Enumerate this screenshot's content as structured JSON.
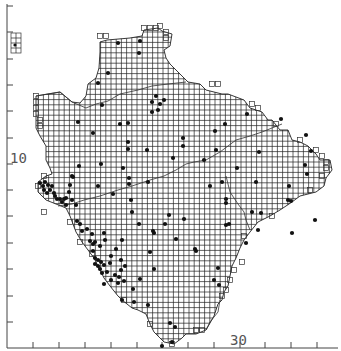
{
  "map": {
    "type": "grid distribution map",
    "axis_labels": {
      "left": "10",
      "bottom": "30"
    },
    "left_axis_ticks_y": [
      6,
      32,
      59,
      85,
      111,
      138,
      164,
      190,
      216,
      243,
      269,
      296,
      322
    ],
    "bottom_axis_ticks_x": [
      33,
      59,
      85,
      111,
      137,
      162,
      188,
      214,
      240,
      265,
      291,
      317
    ],
    "grid_cell_px": 5.2,
    "colors": {
      "line": "#222222",
      "dot": "#111111",
      "label": "#555555",
      "background": "#ffffff"
    },
    "records_count_approx": 150,
    "records": [
      [
        118,
        43
      ],
      [
        140,
        41
      ],
      [
        139,
        53
      ],
      [
        108,
        73
      ],
      [
        98,
        83
      ],
      [
        102,
        105
      ],
      [
        156,
        96
      ],
      [
        160,
        104
      ],
      [
        152,
        102
      ],
      [
        152,
        112
      ],
      [
        164,
        100
      ],
      [
        158,
        110
      ],
      [
        78,
        122
      ],
      [
        120,
        124
      ],
      [
        128,
        123
      ],
      [
        93,
        133
      ],
      [
        128,
        142
      ],
      [
        128,
        149
      ],
      [
        147,
        150
      ],
      [
        123,
        168
      ],
      [
        129,
        178
      ],
      [
        129,
        184
      ],
      [
        113,
        194
      ],
      [
        98,
        186
      ],
      [
        183,
        138
      ],
      [
        183,
        146
      ],
      [
        173,
        158
      ],
      [
        148,
        182
      ],
      [
        215,
        131
      ],
      [
        225,
        124
      ],
      [
        281,
        119
      ],
      [
        247,
        114
      ],
      [
        216,
        150
      ],
      [
        204,
        160
      ],
      [
        237,
        168
      ],
      [
        259,
        152
      ],
      [
        306,
        135
      ],
      [
        311,
        151
      ],
      [
        305,
        165
      ],
      [
        307,
        174
      ],
      [
        289,
        186
      ],
      [
        291,
        201
      ],
      [
        315,
        220
      ],
      [
        292,
        233
      ],
      [
        288,
        200
      ],
      [
        222,
        182
      ],
      [
        226,
        199
      ],
      [
        226,
        203
      ],
      [
        256,
        182
      ],
      [
        210,
        186
      ],
      [
        252,
        212
      ],
      [
        261,
        213
      ],
      [
        258,
        230
      ],
      [
        229,
        224
      ],
      [
        226,
        225
      ],
      [
        246,
        243
      ],
      [
        218,
        268
      ],
      [
        214,
        280
      ],
      [
        219,
        285
      ],
      [
        40,
        183
      ],
      [
        45,
        182
      ],
      [
        43,
        186
      ],
      [
        48,
        185
      ],
      [
        52,
        186
      ],
      [
        50,
        190
      ],
      [
        44,
        190
      ],
      [
        47,
        193
      ],
      [
        54,
        193
      ],
      [
        55,
        196
      ],
      [
        57,
        199
      ],
      [
        60,
        199
      ],
      [
        62,
        202
      ],
      [
        64,
        199
      ],
      [
        66,
        198
      ],
      [
        70,
        185
      ],
      [
        72,
        176
      ],
      [
        69,
        192
      ],
      [
        72,
        200
      ],
      [
        76,
        205
      ],
      [
        66,
        205
      ],
      [
        73,
        177
      ],
      [
        79,
        166
      ],
      [
        101,
        164
      ],
      [
        77,
        221
      ],
      [
        80,
        224
      ],
      [
        82,
        231
      ],
      [
        87,
        229
      ],
      [
        92,
        234
      ],
      [
        90,
        241
      ],
      [
        95,
        242
      ],
      [
        100,
        246
      ],
      [
        105,
        240
      ],
      [
        104,
        233
      ],
      [
        93,
        244
      ],
      [
        93,
        251
      ],
      [
        95,
        258
      ],
      [
        98,
        260
      ],
      [
        95,
        264
      ],
      [
        98,
        266
      ],
      [
        101,
        262
      ],
      [
        100,
        269
      ],
      [
        104,
        265
      ],
      [
        102,
        273
      ],
      [
        107,
        272
      ],
      [
        110,
        263
      ],
      [
        111,
        256
      ],
      [
        116,
        249
      ],
      [
        122,
        240
      ],
      [
        121,
        260
      ],
      [
        115,
        275
      ],
      [
        118,
        283
      ],
      [
        104,
        284
      ],
      [
        119,
        277
      ],
      [
        111,
        280
      ],
      [
        133,
        289
      ],
      [
        140,
        279
      ],
      [
        154,
        269
      ],
      [
        150,
        252
      ],
      [
        153,
        231
      ],
      [
        139,
        224
      ],
      [
        132,
        212
      ],
      [
        131,
        200
      ],
      [
        154,
        233
      ],
      [
        165,
        224
      ],
      [
        184,
        219
      ],
      [
        169,
        215
      ],
      [
        176,
        239
      ],
      [
        195,
        249
      ],
      [
        196,
        251
      ],
      [
        122,
        300
      ],
      [
        134,
        302
      ],
      [
        148,
        305
      ],
      [
        170,
        323
      ],
      [
        175,
        327
      ],
      [
        162,
        346
      ],
      [
        172,
        342
      ],
      [
        125,
        266
      ],
      [
        121,
        270
      ],
      [
        124,
        281
      ]
    ]
  }
}
